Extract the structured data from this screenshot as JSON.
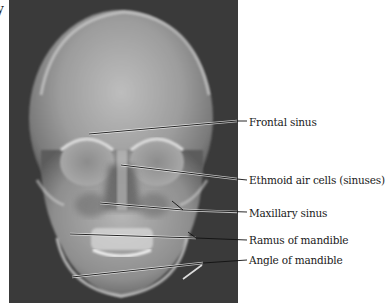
{
  "figure": {
    "clipped_title_fragment": "y",
    "image_description": "Frontal (PA) radiograph of skull",
    "labels": [
      {
        "id": "frontal-sinus",
        "text": "Frontal sinus",
        "label_y": 122,
        "from": [
          80,
          133
        ],
        "to": [
          237,
          121
        ]
      },
      {
        "id": "ethmoid-air-cells",
        "text": "Ethmoid air cells (sinuses)",
        "label_y": 180,
        "from": [
          120,
          165
        ],
        "to": [
          237,
          179
        ]
      },
      {
        "id": "maxillary-sinus",
        "text": "Maxillary sinus",
        "label_y": 213,
        "from": [
          99,
          203
        ],
        "to": [
          237,
          212
        ]
      },
      {
        "id": "ramus-of-mandible",
        "text": "Ramus of mandible",
        "label_y": 240,
        "from": [
          70,
          234
        ],
        "to": [
          237,
          239
        ]
      },
      {
        "id": "angle-of-mandible",
        "text": "Angle of mandible",
        "label_y": 260,
        "from": [
          72,
          277
        ],
        "to": [
          237,
          259
        ]
      }
    ]
  },
  "colors": {
    "background": "#ffffff",
    "xray_background": "#3a3a3a",
    "leader_line": "#111111",
    "label_text": "#1a1a1a"
  }
}
